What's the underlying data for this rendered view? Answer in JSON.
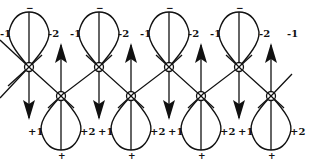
{
  "diagram": {
    "colors": {
      "ink": "#111111",
      "background": "#ffffff"
    },
    "top_atoms": [
      {
        "x": 29,
        "y": 67,
        "lobe_sign": "−",
        "left_label": "-1",
        "right_label": "-2",
        "arrow": "down"
      },
      {
        "x": 99,
        "y": 67,
        "lobe_sign": "−",
        "left_label": "-1",
        "right_label": "-2",
        "arrow": "down"
      },
      {
        "x": 169,
        "y": 67,
        "lobe_sign": "−",
        "left_label": "-1",
        "right_label": "-2",
        "arrow": "down"
      },
      {
        "x": 239,
        "y": 67,
        "lobe_sign": "−",
        "left_label": "-1",
        "right_label": "-2",
        "arrow": "down"
      }
    ],
    "bottom_atoms": [
      {
        "x": 61,
        "y": 96,
        "lobe_sign": "+",
        "left_label": "+1",
        "right_label": "+2",
        "arrow": "up"
      },
      {
        "x": 131,
        "y": 96,
        "lobe_sign": "+",
        "left_label": "+1",
        "right_label": "+2",
        "arrow": "up"
      },
      {
        "x": 201,
        "y": 96,
        "lobe_sign": "+",
        "left_label": "+1",
        "right_label": "+2",
        "arrow": "up"
      },
      {
        "x": 271,
        "y": 96,
        "lobe_sign": "+",
        "left_label": "+1",
        "right_label": "+2",
        "arrow": "up"
      }
    ],
    "extra_labels": [
      {
        "text": "-1",
        "x": 291,
        "y": 37
      }
    ],
    "atom_symbol": "⊗"
  }
}
